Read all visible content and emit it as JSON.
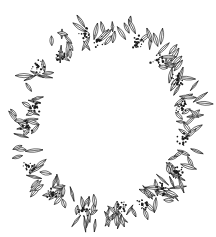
{
  "illustration": {
    "subject": "botanical wreath line drawing",
    "stroke_color": "#1a1a1a",
    "background_color": "#ffffff",
    "center": [
      108,
      122
    ],
    "outer_radius_x": 96,
    "outer_radius_y": 103,
    "inner_radius_x": 64,
    "inner_radius_y": 70
  }
}
